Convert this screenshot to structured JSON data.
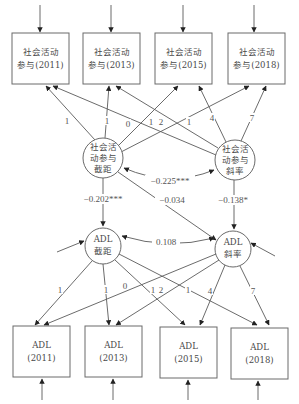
{
  "diagram": {
    "type": "latent growth curve model (parallel process)",
    "top_boxes": [
      {
        "line1": "社会活动",
        "line2": "参与(2011)"
      },
      {
        "line1": "社会活动",
        "line2": "参与(2013)"
      },
      {
        "line1": "社会活动",
        "line2": "参与(2015)"
      },
      {
        "line1": "社会活动",
        "line2": "参与(2018)"
      }
    ],
    "bottom_boxes": [
      {
        "line1": "ADL",
        "line2": "(2011)"
      },
      {
        "line1": "ADL",
        "line2": "(2013)"
      },
      {
        "line1": "ADL",
        "line2": "(2015)"
      },
      {
        "line1": "ADL",
        "line2": "(2018)"
      }
    ],
    "latent": {
      "social_intercept": {
        "line1": "社会活",
        "line2": "动参与",
        "line3": "截距"
      },
      "social_slope": {
        "line1": "社会活",
        "line2": "动参与",
        "line3": "斜率"
      },
      "adl_intercept": {
        "line1": "ADL",
        "line2": "截距"
      },
      "adl_slope": {
        "line1": "ADL",
        "line2": "斜率"
      }
    },
    "loadings_top": {
      "intercept": [
        "1",
        "1",
        "1",
        "1"
      ],
      "slope": [
        "0",
        "2",
        "4",
        "7"
      ]
    },
    "loadings_bottom": {
      "intercept": [
        "1",
        "1",
        "1",
        "1"
      ],
      "slope": [
        "0",
        "2",
        "4",
        "7"
      ]
    },
    "paths": {
      "social_covariance": "−0.225***",
      "si_to_adl_i": "−0.202***",
      "si_to_adl_s": "−0.034",
      "ss_to_adl_s": "−0.138*",
      "adl_residual_covariance": "0.108"
    }
  }
}
